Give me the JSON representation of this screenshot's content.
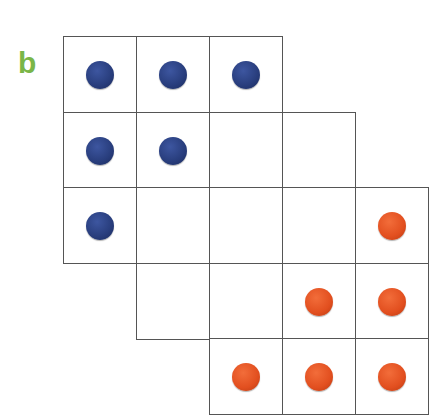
{
  "panel_label": "b",
  "colors": {
    "label": "#7ab648",
    "blue": "#283d7c",
    "orange": "#e24f1f",
    "grid": "#555555"
  },
  "grid": {
    "origin": [
      63,
      36
    ],
    "cell_size": [
      73,
      75.5
    ],
    "cells": [
      {
        "row": 0,
        "col": 0,
        "dot": "blue"
      },
      {
        "row": 0,
        "col": 1,
        "dot": "blue"
      },
      {
        "row": 0,
        "col": 2,
        "dot": "blue"
      },
      {
        "row": 1,
        "col": 0,
        "dot": "blue"
      },
      {
        "row": 1,
        "col": 1,
        "dot": "blue"
      },
      {
        "row": 1,
        "col": 2,
        "dot": null
      },
      {
        "row": 1,
        "col": 3,
        "dot": null
      },
      {
        "row": 2,
        "col": 0,
        "dot": "blue"
      },
      {
        "row": 2,
        "col": 1,
        "dot": null
      },
      {
        "row": 2,
        "col": 2,
        "dot": null
      },
      {
        "row": 2,
        "col": 3,
        "dot": null
      },
      {
        "row": 2,
        "col": 4,
        "dot": "orange"
      },
      {
        "row": 3,
        "col": 1,
        "dot": null
      },
      {
        "row": 3,
        "col": 2,
        "dot": null
      },
      {
        "row": 3,
        "col": 3,
        "dot": "orange"
      },
      {
        "row": 3,
        "col": 4,
        "dot": "orange"
      },
      {
        "row": 4,
        "col": 2,
        "dot": "orange"
      },
      {
        "row": 4,
        "col": 3,
        "dot": "orange"
      },
      {
        "row": 4,
        "col": 4,
        "dot": "orange"
      }
    ]
  }
}
